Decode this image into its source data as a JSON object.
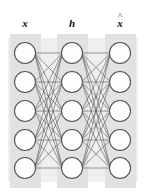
{
  "figure": {
    "type": "neural-network-diagram",
    "subtype": "autoencoder",
    "width": 146,
    "height": 191,
    "background_color": "#ffffff"
  },
  "labels": {
    "input": "x",
    "hidden": "h",
    "output": "x",
    "output_accent": "^",
    "output_full": "x̂"
  },
  "layers": [
    {
      "id": "input",
      "label": "x",
      "node_count": 5,
      "center_x": 25,
      "band_x": 10,
      "band_width": 31,
      "node_y": [
        53,
        82,
        111,
        140,
        168
      ]
    },
    {
      "id": "hidden",
      "label": "h",
      "node_count": 5,
      "center_x": 72,
      "band_x": 57,
      "band_width": 31,
      "node_y": [
        53,
        82,
        111,
        140,
        168
      ]
    },
    {
      "id": "output",
      "label": "x̂",
      "node_count": 5,
      "center_x": 120,
      "band_x": 105,
      "band_width": 31,
      "node_y": [
        53,
        82,
        111,
        140,
        168
      ]
    }
  ],
  "node_style": {
    "radius": 10.5,
    "fill": "#fdfdfd",
    "stroke": "#555555",
    "stroke_width": 1.1
  },
  "edges": {
    "fully_connected": true,
    "between": [
      [
        "input",
        "hidden"
      ],
      [
        "hidden",
        "output"
      ]
    ],
    "stroke": "#4a4a4a",
    "stroke_width": 0.55
  },
  "bands": {
    "outer": {
      "x": 8,
      "y": 38,
      "width": 130,
      "height": 144,
      "fill": "#efefef"
    },
    "columns_fill": "#e0e0e0",
    "column_y": 34,
    "column_height": 154
  },
  "label_positions": {
    "y": 18,
    "input_x": 25,
    "hidden_x": 72,
    "output_x": 120
  }
}
